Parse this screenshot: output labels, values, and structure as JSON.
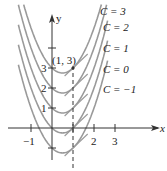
{
  "chart_data": {
    "type": "line",
    "title": "",
    "xlabel": "x",
    "ylabel": "y",
    "x_ticks": [
      "-1",
      "2",
      "3"
    ],
    "y_ticks": [
      "1",
      "2",
      "3"
    ],
    "xlim": [
      -1.6,
      4.6
    ],
    "ylim": [
      -1.8,
      5.5
    ],
    "annotation_point": {
      "label": "(1, 3)",
      "x": 1,
      "y": 3
    },
    "dashed_line": {
      "x": 1
    },
    "series": [
      {
        "name": "C = 3",
        "C": 3
      },
      {
        "name": "C = 2",
        "C": 2
      },
      {
        "name": "C = 1",
        "C": 1
      },
      {
        "name": "C = 0",
        "C": 0
      },
      {
        "name": "C = -1",
        "C": -1
      }
    ],
    "curve_color": "#9a9a9a"
  },
  "labels": {
    "y_axis": "y",
    "x_axis": "x",
    "point": "(1, 3)",
    "tick_neg1": "−1",
    "tick_2": "2",
    "tick_3": "3",
    "tick_y1": "1",
    "tick_y2": "2",
    "tick_y3": "3",
    "c3": "C = 3",
    "c2": "C = 2",
    "c1": "C = 1",
    "c0": "C = 0",
    "cm1": "C = −1"
  }
}
